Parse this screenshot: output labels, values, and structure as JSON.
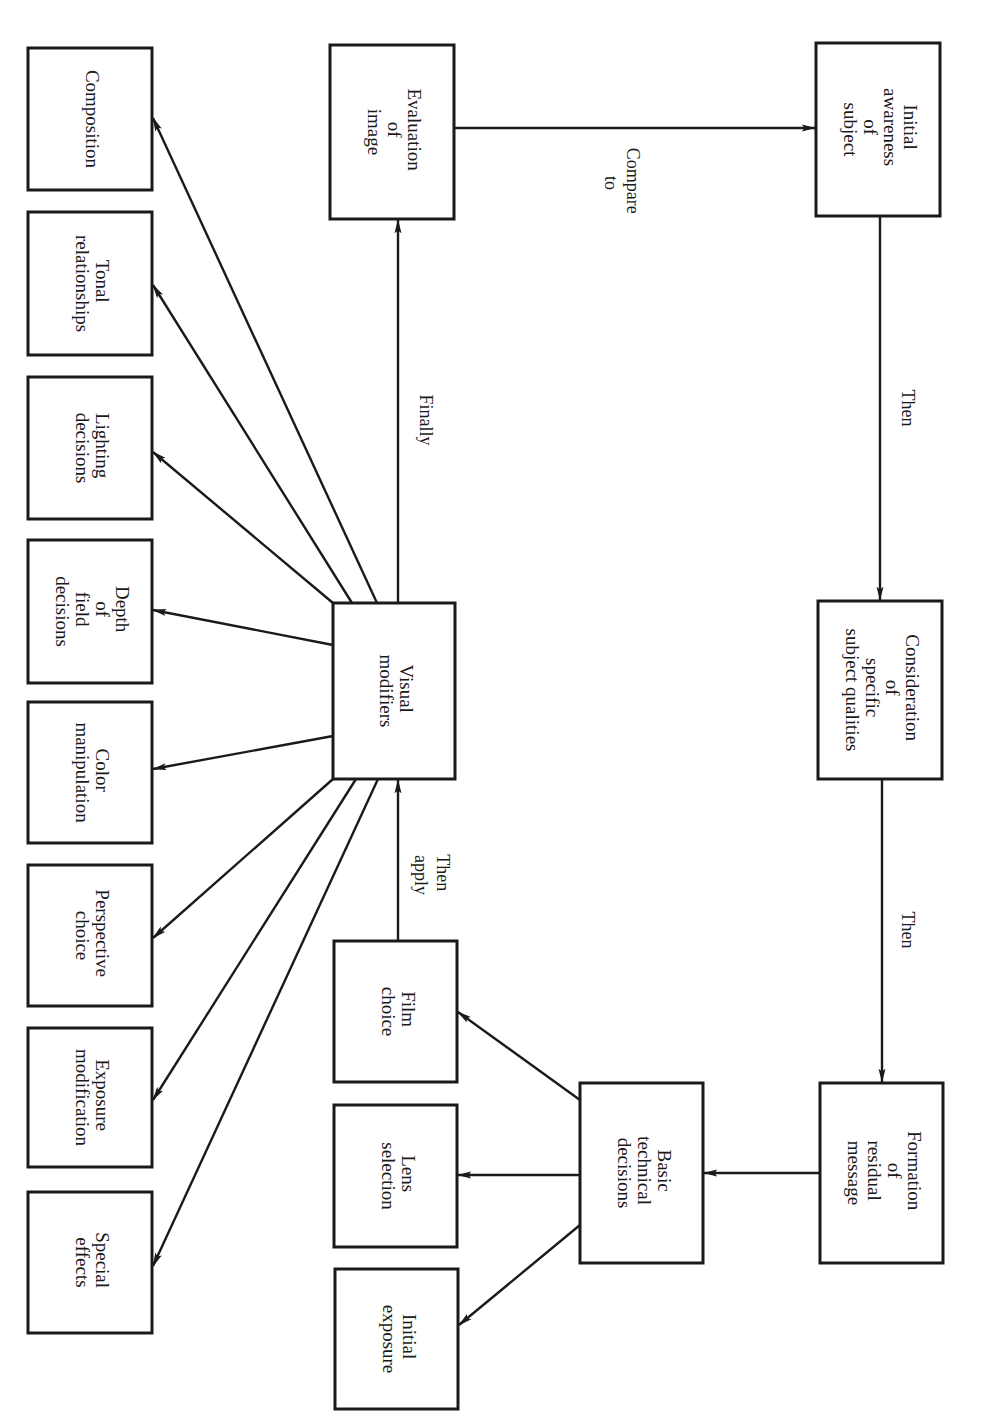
{
  "diagram": {
    "orientation": "rotated-90-clockwise",
    "nodes": {
      "initial_awareness": {
        "lines": [
          "Initial",
          "awareness",
          "of",
          "subject"
        ]
      },
      "consideration": {
        "lines": [
          "Consideration",
          "of",
          "specific",
          "subject qualities"
        ]
      },
      "formation": {
        "lines": [
          "Formation",
          "of",
          "residual",
          "message"
        ]
      },
      "basic_technical": {
        "lines": [
          "Basic",
          "technical",
          "decisions"
        ]
      },
      "film_choice": {
        "lines": [
          "Film",
          "choice"
        ]
      },
      "lens_selection": {
        "lines": [
          "Lens",
          "selection"
        ]
      },
      "initial_exposure": {
        "lines": [
          "Initial",
          "exposure"
        ]
      },
      "visual_modifiers": {
        "lines": [
          "Visual",
          "modifiers"
        ]
      },
      "evaluation": {
        "lines": [
          "Evaluation",
          "of",
          "image"
        ]
      },
      "composition": {
        "lines": [
          "Composition"
        ]
      },
      "tonal": {
        "lines": [
          "Tonal",
          "relationships"
        ]
      },
      "lighting": {
        "lines": [
          "Lighting",
          "decisions"
        ]
      },
      "depth": {
        "lines": [
          "Depth",
          "of",
          "field",
          "decisions"
        ]
      },
      "color": {
        "lines": [
          "Color",
          "manipulation"
        ]
      },
      "perspective": {
        "lines": [
          "Perspective",
          "choice"
        ]
      },
      "exposure_mod": {
        "lines": [
          "Exposure",
          "modification"
        ]
      },
      "special": {
        "lines": [
          "Special",
          "effects"
        ]
      }
    },
    "edges": {
      "awareness_to_consideration": {
        "lines": [
          "Then"
        ]
      },
      "consideration_to_formation": {
        "lines": [
          "Then"
        ]
      },
      "film_to_visual": {
        "lines": [
          "Then",
          "apply"
        ]
      },
      "visual_to_evaluation": {
        "lines": [
          "Finally"
        ]
      },
      "evaluation_to_awareness": {
        "lines": [
          "Compare",
          "to"
        ]
      }
    }
  }
}
